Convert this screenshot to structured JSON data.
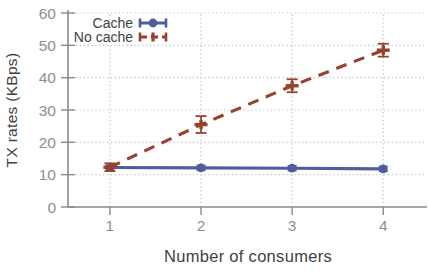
{
  "chart_data": {
    "type": "line",
    "title": "",
    "xlabel": "Number of consumers",
    "ylabel": "TX rates (KBps)",
    "x": [
      1,
      2,
      3,
      4
    ],
    "xticks": [
      1,
      2,
      3,
      4
    ],
    "xtick_labels": [
      "1",
      "2",
      "3",
      "4"
    ],
    "yticks": [
      0,
      10,
      20,
      30,
      40,
      50,
      60
    ],
    "xlim": [
      0.54,
      4.48
    ],
    "ylim": [
      0,
      60
    ],
    "grid": true,
    "grid_style": "dotted",
    "legend_position": "top-left-inside",
    "series": [
      {
        "name": "Cache",
        "color": "#4f5d9e",
        "line_style": "solid",
        "marker": "circle",
        "values": [
          12.2,
          12.1,
          12.0,
          11.8
        ],
        "errors": [
          0.7,
          0.7,
          0.7,
          0.7
        ]
      },
      {
        "name": "No cache",
        "color": "#97422c",
        "line_style": "dashed",
        "marker": "plus",
        "values": [
          12.3,
          25.5,
          37.5,
          48.5
        ],
        "errors": [
          1.2,
          2.6,
          2.0,
          2.0
        ]
      }
    ]
  },
  "colors": {
    "background": "#ffffff",
    "grid": "#c3c3c3",
    "axis": "#8a8a8a",
    "tick_label": "#8f8f8f",
    "axis_label": "#414141",
    "legend_text": "#414141"
  }
}
